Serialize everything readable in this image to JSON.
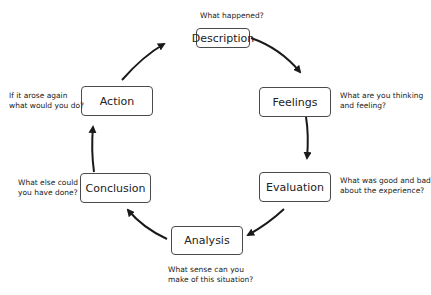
{
  "stages": [
    {
      "id": "description",
      "label": "Description",
      "prompt": [
        "What happened?"
      ]
    },
    {
      "id": "feelings",
      "label": "Feelings",
      "prompt": [
        "What are you thinking",
        "and feeling?"
      ]
    },
    {
      "id": "evaluation",
      "label": "Evaluation",
      "prompt": [
        "What was good and bad",
        "about the experience?"
      ]
    },
    {
      "id": "analysis",
      "label": "Analysis",
      "prompt": [
        "What sense can you",
        "make of this situation?"
      ]
    },
    {
      "id": "conclusion",
      "label": "Conclusion",
      "prompt": [
        "What else could",
        "you have done?"
      ]
    },
    {
      "id": "action",
      "label": "Action",
      "prompt": [
        "If it arose again",
        "what would you do?"
      ]
    }
  ],
  "colors": {
    "stroke": "#1a1a1a",
    "box_border": "#4a4a4a",
    "text": "#222222"
  }
}
